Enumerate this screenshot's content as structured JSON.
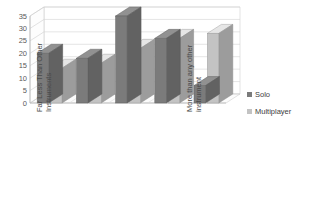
{
  "top_sliver_text": "· ·   ·    ·        ·                            ·    ·    ·        ·",
  "legend": {
    "position": "right",
    "entries": [
      {
        "label": "Solo",
        "color": "#7b7b7b"
      },
      {
        "label": "Multiplayer",
        "color": "#c3c3c3"
      }
    ]
  },
  "axis": {
    "y_ticks": [
      "0",
      "5",
      "10",
      "15",
      "20",
      "25",
      "30",
      "35"
    ],
    "y_min": 0,
    "y_max": 35,
    "y_step": 5
  },
  "category_labels": {
    "first": {
      "line1": "Far Less Than Other",
      "line2": "Instruments"
    },
    "last": {
      "line1": "More than any other",
      "line2": "instrument"
    }
  },
  "chart_data": {
    "type": "bar",
    "title": "",
    "subtitle": "",
    "xlabel": "",
    "ylabel": "",
    "ylim": [
      0,
      35
    ],
    "ytick_step": 5,
    "grid": true,
    "three_d": true,
    "legend_position": "right",
    "categories": [
      "Far Less Than Other Instruments",
      "",
      "",
      "",
      "More than any other instrument"
    ],
    "series": [
      {
        "name": "Solo",
        "color": "#7b7b7b",
        "values": [
          20,
          18,
          35,
          26,
          7
        ]
      },
      {
        "name": "Multiplayer",
        "color": "#c3c3c3",
        "values": [
          14,
          16,
          22,
          26,
          28
        ]
      }
    ]
  }
}
